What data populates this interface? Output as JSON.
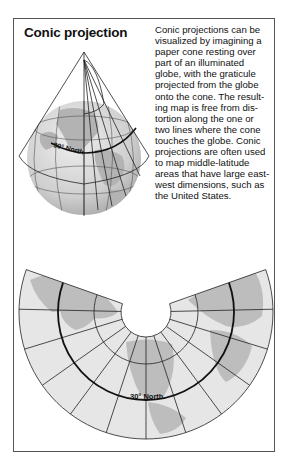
{
  "figure": {
    "title": "Conic projection",
    "description_lines": [
      "Conic projections can be",
      "visualized by imagining a",
      "paper cone resting over",
      "part of an illuminated",
      "globe, with the graticule",
      "projected from the globe",
      "onto the cone. The result-",
      "ing map is free from dis-",
      "tortion along the one or",
      "two lines where the cone",
      "touches the globe. Conic",
      "projections are often used",
      "to map middle-latitude",
      "areas that have large east-",
      "west dimensions, such as",
      "the United States."
    ],
    "globe_label": "30° North",
    "map_label": "30° North"
  },
  "colors": {
    "frame": "#555555",
    "line": "#222222",
    "land": "#b8b8b8",
    "ocean": "#e6e6e6",
    "globe_shade": "#cfcfcf"
  }
}
